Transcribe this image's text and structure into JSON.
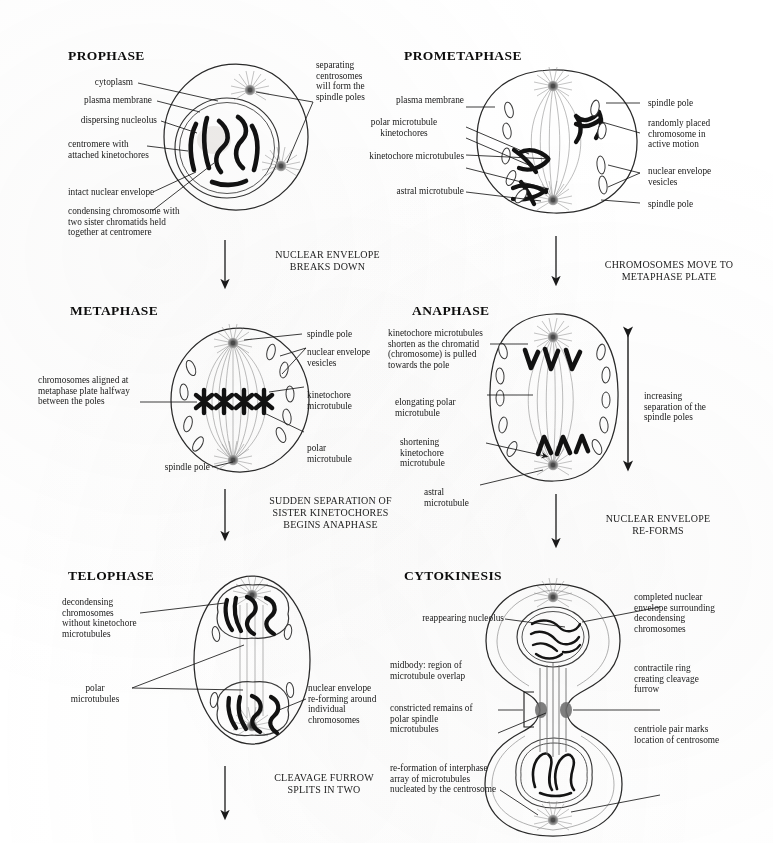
{
  "figure": {
    "ink_color": "#1a1a1a",
    "background_color": "#ffffff"
  },
  "panels": [
    {
      "id": "prophase",
      "title": "PROPHASE",
      "labels_left": [
        "cytoplasm",
        "plasma membrane",
        "dispersing nucleolus",
        "centromere with\nattached kinetochores",
        "intact nuclear envelope",
        "condensing chromosome with\ntwo sister chromatids held\ntogether at centromere"
      ],
      "labels_right": [
        "separating\ncentrosomes\nwill form the\nspindle poles"
      ]
    },
    {
      "id": "prometaphase",
      "title": "PROMETAPHASE",
      "labels_left": [
        "plasma membrane",
        "polar microtubule\nkinetochores",
        "kinetochore microtubules",
        "astral microtubule"
      ],
      "labels_right": [
        "spindle pole",
        "randomly placed\nchromosome in\nactive motion",
        "nuclear envelope\nvesicles",
        "spindle pole"
      ]
    },
    {
      "id": "metaphase",
      "title": "METAPHASE",
      "labels_left": [
        "chromosomes aligned at\nmetaphase plate halfway\nbetween the poles",
        "spindle pole"
      ],
      "labels_right": [
        "spindle pole",
        "nuclear envelope\nvesicles",
        "kinetochore\nmicrotubule",
        "polar\nmicrotubule"
      ]
    },
    {
      "id": "anaphase",
      "title": "ANAPHASE",
      "labels_left": [
        "kinetochore microtubules\nshorten as the chromatid\n(chromosome) is pulled\ntowards the pole",
        "elongating polar\nmicrotubule",
        "shortening\nkinetochore\nmicrotubule",
        "astral\nmicrotubule"
      ],
      "labels_right": [
        "increasing\nseparation of the\nspindle poles"
      ]
    },
    {
      "id": "telophase",
      "title": "TELOPHASE",
      "labels_left": [
        "decondensing\nchromosomes\nwithout kinetochore\nmicrotubules",
        "polar\nmicrotubules"
      ],
      "labels_right": [
        "nuclear envelope\nre-forming around\nindividual\nchromosomes"
      ]
    },
    {
      "id": "cytokinesis",
      "title": "CYTOKINESIS",
      "labels_left": [
        "reappearing nucleolus",
        "midbody: region of\nmicrotubule overlap",
        "constricted remains of\npolar spindle\nmicrotubules",
        "re-formation of interphase\narray of microtubules\nnucleated by the centrosome"
      ],
      "labels_right": [
        "completed nuclear\nenvelope surrounding\ndecondensing\nchromosomes",
        "contractile ring\ncreating cleavage\nfurrow",
        "centriole pair marks\nlocation of centrosome"
      ]
    }
  ],
  "transitions": [
    {
      "id": "prophase-to-metaphase",
      "text": "NUCLEAR ENVELOPE\nBREAKS DOWN"
    },
    {
      "id": "prometaphase-to-anaphase",
      "text": "CHROMOSOMES MOVE TO\nMETAPHASE PLATE"
    },
    {
      "id": "metaphase-to-telophase",
      "text": "SUDDEN SEPARATION OF\nSISTER KINETOCHORES\nBEGINS ANAPHASE"
    },
    {
      "id": "anaphase-to-cytokinesis",
      "text": "NUCLEAR ENVELOPE\nRE-FORMS"
    },
    {
      "id": "telophase-to-end",
      "text": "CLEAVAGE FURROW\nSPLITS IN TWO"
    }
  ]
}
